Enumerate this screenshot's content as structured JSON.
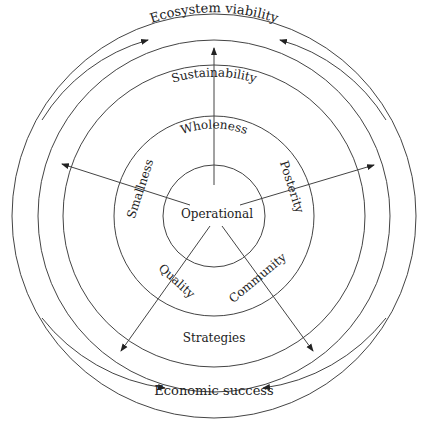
{
  "diagram": {
    "center_label": "Operational",
    "rings": {
      "inner": "Operational",
      "second": "Wholeness",
      "third": "Sustainability",
      "outer_top": "Ecosystem viability",
      "outer_bottom": "Economic success",
      "bottom_band": "Strategies"
    },
    "spokes": [
      "Smallness",
      "Posterity",
      "Quality",
      "Community"
    ],
    "labels": {
      "ecosystem": "Ecosystem viability",
      "sustainability": "Sustainability",
      "wholeness": "Wholeness",
      "operational": "Operational",
      "smallness": "Smallness",
      "posterity": "Posterity",
      "quality": "Quality",
      "community": "Community",
      "strategies": "Strategies",
      "economic": "Economic success"
    }
  }
}
